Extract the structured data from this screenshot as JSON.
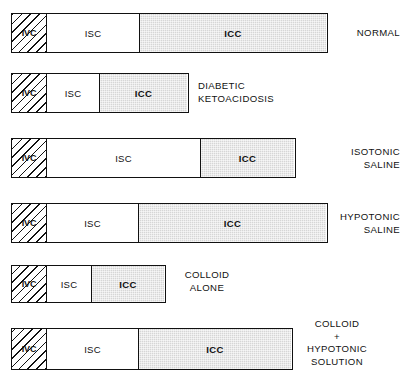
{
  "figure": {
    "compartment_keys": [
      "IVC",
      "ISC",
      "ICC"
    ],
    "colors": {
      "ivc_fill": "#ffffff",
      "ivc_hatch": "#111111",
      "isc_fill": "#ffffff",
      "icc_fill": "#d6d6d6",
      "outline": "#111111",
      "text": "#111111",
      "background": "#ffffff"
    }
  },
  "chart_data": {
    "type": "bar",
    "title": "",
    "xlabel": "",
    "ylabel": "",
    "orientation": "horizontal-stacked",
    "categories": [
      "NORMAL",
      "DIABETIC KETOACIDOSIS",
      "ISOTONIC SALINE",
      "HYPOTONIC SALINE",
      "COLLOID ALONE",
      "COLLOID + HYPOTONIC SOLUTION"
    ],
    "segment_names": [
      "IVC",
      "ISC",
      "ICC"
    ],
    "series": [
      {
        "name": "IVC",
        "values": [
          34,
          34,
          34,
          34,
          34,
          34
        ]
      },
      {
        "name": "ISC",
        "values": [
          93,
          53,
          154,
          92,
          45,
          92
        ]
      },
      {
        "name": "ICC",
        "values": [
          187,
          88,
          94,
          188,
          73,
          153
        ]
      }
    ],
    "units": "pixels (relative compartment width)"
  },
  "rows": [
    {
      "id": "normal",
      "bar_top": 13,
      "bar_left": 11,
      "bar_height": 40,
      "segments": [
        {
          "key": "ivc",
          "label": "IVC",
          "width": 34
        },
        {
          "key": "isc",
          "label": "ISC",
          "width": 93
        },
        {
          "key": "icc",
          "label": "ICC",
          "width": 187
        }
      ],
      "label": "NORMAL",
      "label_align": "align-right",
      "label_left": 330,
      "label_width": 70,
      "label_top": 27
    },
    {
      "id": "diabetic-ketoacidosis",
      "bar_top": 73,
      "bar_left": 11,
      "bar_height": 40,
      "segments": [
        {
          "key": "ivc",
          "label": "IVC",
          "width": 34
        },
        {
          "key": "isc",
          "label": "ISC",
          "width": 53
        },
        {
          "key": "icc",
          "label": "ICC",
          "width": 88
        }
      ],
      "label": "DIABETIC\nKETOACIDOSIS",
      "label_align": "align-left",
      "label_left": 198,
      "label_width": 130,
      "label_top": 80
    },
    {
      "id": "isotonic-saline",
      "bar_top": 138,
      "bar_left": 11,
      "bar_height": 40,
      "segments": [
        {
          "key": "ivc",
          "label": "IVC",
          "width": 34
        },
        {
          "key": "isc",
          "label": "ISC",
          "width": 154
        },
        {
          "key": "icc",
          "label": "ICC",
          "width": 94
        }
      ],
      "label": "ISOTONIC\nSALINE",
      "label_align": "align-right",
      "label_left": 318,
      "label_width": 82,
      "label_top": 146
    },
    {
      "id": "hypotonic-saline",
      "bar_top": 203,
      "bar_left": 11,
      "bar_height": 40,
      "segments": [
        {
          "key": "ivc",
          "label": "IVC",
          "width": 34
        },
        {
          "key": "isc",
          "label": "ISC",
          "width": 92
        },
        {
          "key": "icc",
          "label": "ICC",
          "width": 188
        }
      ],
      "label": "HYPOTONIC\nSALINE",
      "label_align": "align-right",
      "label_left": 318,
      "label_width": 82,
      "label_top": 211
    },
    {
      "id": "colloid-alone",
      "bar_top": 265,
      "bar_left": 11,
      "bar_height": 38,
      "segments": [
        {
          "key": "ivc",
          "label": "IVC",
          "width": 34
        },
        {
          "key": "isc",
          "label": "ISC",
          "width": 45
        },
        {
          "key": "icc",
          "label": "ICC",
          "width": 73
        }
      ],
      "label": "COLLOID\nALONE",
      "label_align": "align-center",
      "label_left": 176,
      "label_width": 62,
      "label_top": 269
    },
    {
      "id": "colloid-plus-hypotonic-solution",
      "bar_top": 328,
      "bar_left": 11,
      "bar_height": 42,
      "segments": [
        {
          "key": "ivc",
          "label": "IVC",
          "width": 34
        },
        {
          "key": "isc",
          "label": "ISC",
          "width": 92
        },
        {
          "key": "icc",
          "label": "ICC",
          "width": 153
        }
      ],
      "label": "COLLOID\n+\nHYPOTONIC\nSOLUTION",
      "label_align": "align-center",
      "label_left": 294,
      "label_width": 86,
      "label_top": 318
    }
  ]
}
